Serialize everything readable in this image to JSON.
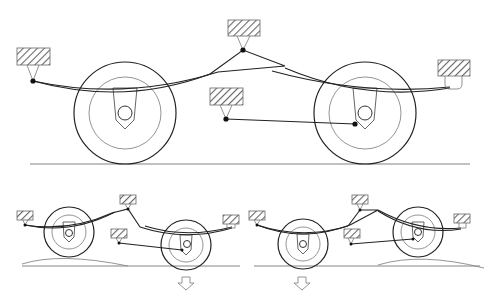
{
  "figure": {
    "colors": {
      "line": "#222222",
      "light_line": "#888888",
      "hatch": "#666666",
      "background": "#ffffff"
    }
  },
  "panels": [
    {
      "id": "level",
      "label": "Level ground",
      "wheels": [
        {
          "cx": 125,
          "cy": 113,
          "r": 51
        },
        {
          "cx": 365,
          "cy": 113,
          "r": 51
        }
      ],
      "frame_mounts": 4,
      "arrow": null
    },
    {
      "id": "left-bump",
      "label": "Rear wheel dropping",
      "wheels": [
        {
          "cx": 67,
          "cy": 230,
          "r": 25
        },
        {
          "cx": 185,
          "cy": 242,
          "r": 25
        }
      ],
      "arrow": "down-under-right-wheel"
    },
    {
      "id": "right-bump",
      "label": "Front wheel dropping",
      "wheels": [
        {
          "cx": 302,
          "cy": 244,
          "r": 25
        },
        {
          "cx": 418,
          "cy": 232,
          "r": 25
        }
      ],
      "arrow": "down-under-left-wheel"
    }
  ]
}
